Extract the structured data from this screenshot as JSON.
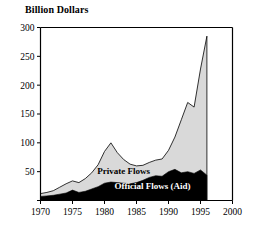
{
  "chart_data": {
    "type": "area",
    "title": "",
    "ylabel": "Billion Dollars",
    "xlabel": "",
    "annotation": "Source: World Bank",
    "xlim": [
      1970,
      2000
    ],
    "ylim": [
      0,
      300
    ],
    "grid": false,
    "legend_position": "inline-on-plot",
    "stacked": true,
    "x": [
      1970,
      1971,
      1972,
      1973,
      1974,
      1975,
      1976,
      1977,
      1978,
      1979,
      1980,
      1981,
      1982,
      1983,
      1984,
      1985,
      1986,
      1987,
      1988,
      1989,
      1990,
      1991,
      1992,
      1993,
      1994,
      1995,
      1996
    ],
    "series": [
      {
        "name": "Official Flows (Aid)",
        "color": "#000000",
        "values": [
          7,
          8,
          9,
          11,
          13,
          18,
          14,
          16,
          20,
          24,
          30,
          32,
          31,
          30,
          29,
          31,
          35,
          40,
          43,
          42,
          50,
          54,
          48,
          50,
          47,
          53,
          44
        ]
      },
      {
        "name": "Private Flows",
        "color": "#d9d9d9",
        "values": [
          5,
          6,
          8,
          12,
          16,
          16,
          17,
          22,
          28,
          38,
          55,
          68,
          52,
          41,
          34,
          29,
          26,
          26,
          27,
          30,
          37,
          56,
          92,
          120,
          115,
          175,
          241
        ]
      }
    ],
    "totals": [
      12,
      14,
      17,
      23,
      29,
      34,
      31,
      38,
      48,
      62,
      85,
      100,
      83,
      71,
      63,
      60,
      61,
      66,
      70,
      72,
      87,
      110,
      140,
      170,
      162,
      228,
      285
    ],
    "y_ticks": [
      0,
      50,
      100,
      150,
      200,
      250,
      300
    ],
    "y_tick_labels": [
      "",
      "50",
      "100",
      "150",
      "200",
      "250",
      "300"
    ],
    "x_ticks": [
      1970,
      1975,
      1980,
      1985,
      1990,
      1995,
      2000
    ],
    "x_tick_labels": [
      "1970",
      "1975",
      "1980",
      "1985",
      "1990",
      "1995",
      "2000"
    ],
    "series_labels": [
      {
        "text": "Private Flows",
        "x": 1983.0,
        "y": 46,
        "fill": "#000000"
      },
      {
        "text": "Official Flows (Aid)",
        "x": 1987.5,
        "y": 20,
        "fill": "#ffffff"
      }
    ]
  }
}
